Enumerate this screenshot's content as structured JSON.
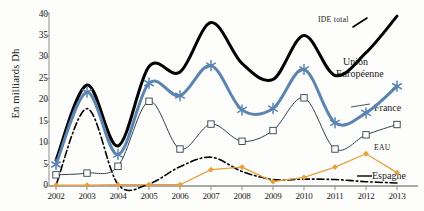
{
  "chart": {
    "type": "line",
    "ylabel": "En milliards Dh",
    "xlabel": "",
    "title": ""
  },
  "axis": {
    "y_ticks": [
      "0",
      "5",
      "10",
      "15",
      "20",
      "25",
      "30",
      "35",
      "40"
    ],
    "x_ticks": [
      "2002",
      "2003",
      "2004",
      "2005",
      "2006",
      "2007",
      "2008",
      "2009",
      "2010",
      "2011",
      "2012",
      "2013"
    ]
  },
  "labels": {
    "ide_total": "IDE total",
    "union_line1": "Union",
    "union_line2": "Européenne",
    "france": "France",
    "eau": "EAU",
    "espagne": "Espagne"
  },
  "colors": {
    "ide_total": "#000000",
    "union_europeenne": "#5b84b1",
    "france": "#33404d",
    "eau": "#e6a13c",
    "espagne": "#000000",
    "axis": "#8c8c8c",
    "background": "#fdfdfb"
  },
  "chart_data": {
    "type": "line",
    "title": "",
    "xlabel": "",
    "ylabel": "En milliards Dh",
    "ylim": [
      0,
      40
    ],
    "grid": false,
    "legend": "inline-right-labels",
    "categories": [
      "2002",
      "2003",
      "2004",
      "2005",
      "2006",
      "2007",
      "2008",
      "2009",
      "2010",
      "2011",
      "2012",
      "2013"
    ],
    "series": [
      {
        "name": "IDE total",
        "color": "#000000",
        "style": "thick-smooth-black",
        "marker": "none",
        "values": [
          6.0,
          23.5,
          9.3,
          27.8,
          26.5,
          38.0,
          28.5,
          24.8,
          35.0,
          25.7,
          31.0,
          39.5
        ]
      },
      {
        "name": "Union Européenne",
        "color": "#5b84b1",
        "style": "thick-smooth-blue",
        "marker": "asterisk",
        "values": [
          5.0,
          21.8,
          7.3,
          23.9,
          21.0,
          28.0,
          17.7,
          18.0,
          27.1,
          14.7,
          17.0,
          23.2
        ]
      },
      {
        "name": "France",
        "color": "#33404d",
        "style": "thin-line",
        "marker": "square",
        "values": [
          2.6,
          3.0,
          4.6,
          19.7,
          8.6,
          14.4,
          10.4,
          12.9,
          20.5,
          8.6,
          11.9,
          14.3
        ]
      },
      {
        "name": "EAU",
        "color": "#e6a13c",
        "style": "thin-line",
        "marker": "diamond",
        "values": [
          0.2,
          0.2,
          0.3,
          0.3,
          0.3,
          3.8,
          4.4,
          1.0,
          2.0,
          4.4,
          7.5,
          3.1
        ]
      },
      {
        "name": "Espagne",
        "color": "#000000",
        "style": "dash-dot",
        "marker": "none",
        "values": [
          0.2,
          18.0,
          0.4,
          0.5,
          4.5,
          6.7,
          3.4,
          1.5,
          1.6,
          1.5,
          1.0,
          0.7
        ]
      }
    ]
  }
}
